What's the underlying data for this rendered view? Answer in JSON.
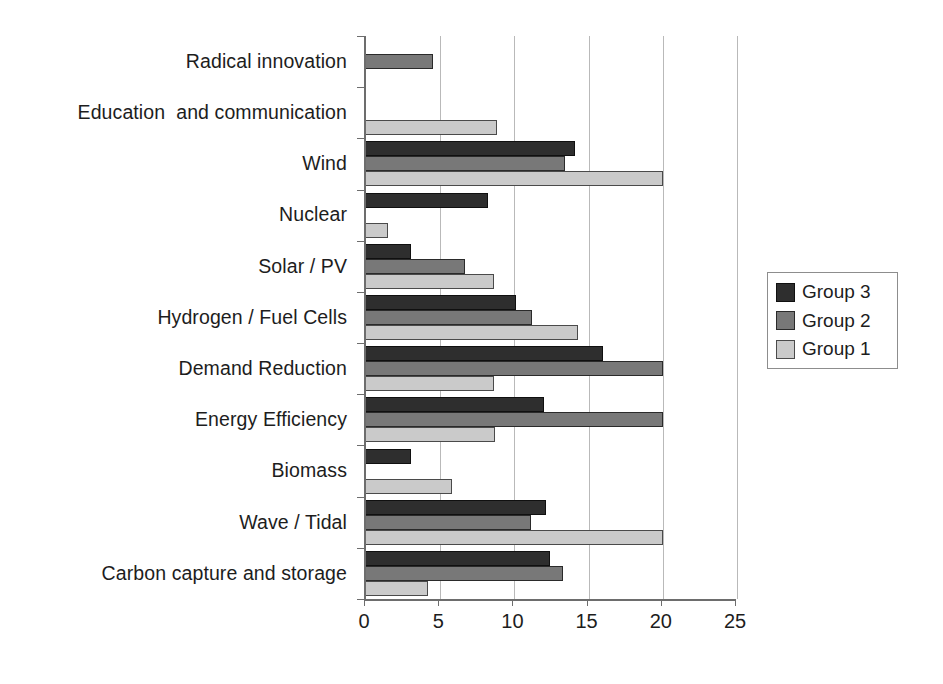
{
  "chart_data": {
    "type": "bar",
    "orientation": "horizontal",
    "title": "",
    "subtitle": "",
    "xlabel": "",
    "ylabel": "",
    "xlim": [
      0,
      25
    ],
    "xticks": [
      0,
      5,
      10,
      15,
      20,
      25
    ],
    "xtick_labels": [
      "0",
      "5",
      "10",
      "15",
      "20",
      "25"
    ],
    "grid": true,
    "grid_axis": "x",
    "legend_position": "right",
    "categories": [
      "Radical innovation",
      "Education  and communication",
      "Wind",
      "Nuclear",
      "Solar / PV",
      "Hydrogen / Fuel Cells",
      "Demand Reduction",
      "Energy Efficiency",
      "Biomass",
      "Wave / Tidal",
      "Carbon capture and storage"
    ],
    "series": [
      {
        "name": "Group 3",
        "color": "#2e2e2e",
        "values": [
          0,
          0,
          14.1,
          8.2,
          3.0,
          10.1,
          16.0,
          12.0,
          3.0,
          12.1,
          12.4
        ]
      },
      {
        "name": "Group 2",
        "color": "#787878",
        "values": [
          4.5,
          0,
          13.4,
          0,
          6.7,
          11.2,
          20.0,
          20.0,
          0,
          11.1,
          13.3
        ]
      },
      {
        "name": "Group 1",
        "color": "#cacaca",
        "values": [
          0,
          8.8,
          20.0,
          1.5,
          8.6,
          14.3,
          8.6,
          8.7,
          5.8,
          20.0,
          4.2
        ]
      }
    ]
  },
  "legend": {
    "items": [
      {
        "label": "Group 3",
        "swatch": "g3"
      },
      {
        "label": "Group 2",
        "swatch": "g2"
      },
      {
        "label": "Group 1",
        "swatch": "g1"
      }
    ]
  },
  "colors": {
    "group3": "#2e2e2e",
    "group2": "#787878",
    "group1": "#cacaca",
    "axis": "#6d6d6d",
    "grid": "#b9b9b9",
    "background": "#ffffff"
  }
}
